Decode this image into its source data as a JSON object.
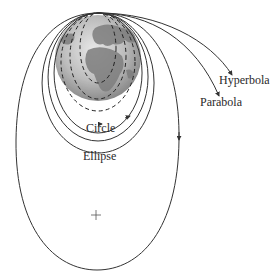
{
  "diagram": {
    "title": "",
    "labels": {
      "hyperbola": "Hyperbola",
      "parabola": "Parabola",
      "circle": "Circle",
      "ellipse": "Ellipse"
    },
    "focus_marker": "+",
    "colors": {
      "stroke": "#333333",
      "earth_light": "#d9d9d9",
      "earth_dark": "#7a7a7a",
      "land": "#8c8c8c",
      "background": "#ffffff"
    }
  }
}
